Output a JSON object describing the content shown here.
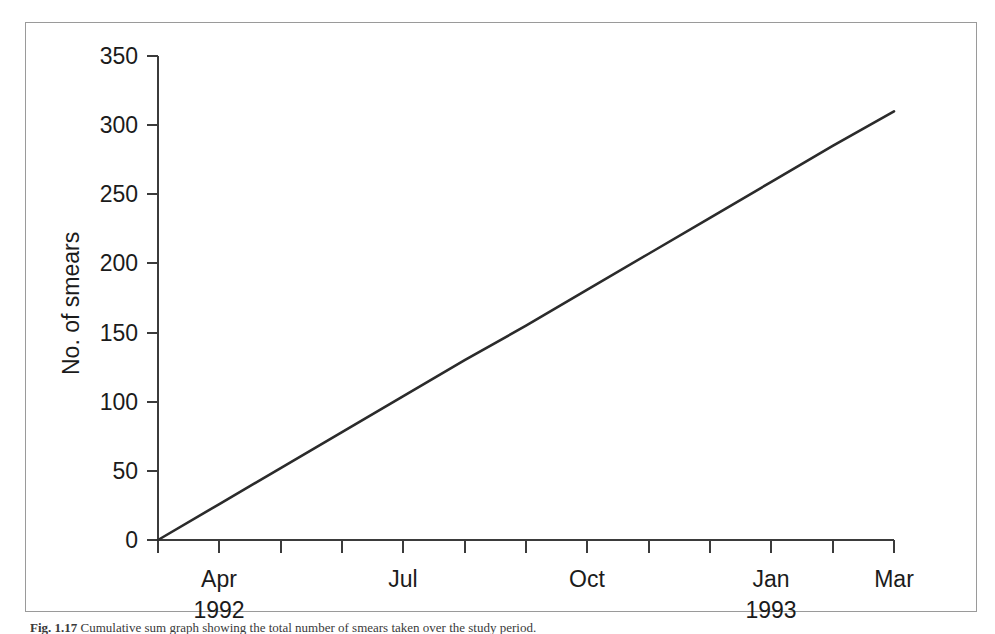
{
  "figure": {
    "caption_label": "Fig. 1.17",
    "caption_text": "Cumulative sum graph showing the total number of smears taken over the study period."
  },
  "chart_data": {
    "type": "line",
    "title": "",
    "xlabel": "",
    "ylabel": "No. of smears",
    "ylim": [
      0,
      350
    ],
    "yticks": [
      0,
      50,
      100,
      150,
      200,
      250,
      300,
      350
    ],
    "ytick_labels": [
      "0",
      "50",
      "100",
      "150",
      "200",
      "250",
      "300",
      "350"
    ],
    "grid": false,
    "legend": "none",
    "x_tick_count": 13,
    "x_tick_labels": [
      {
        "index": 1,
        "month": "Apr",
        "year": "1992"
      },
      {
        "index": 4,
        "month": "Jul",
        "year": ""
      },
      {
        "index": 7,
        "month": "Oct",
        "year": ""
      },
      {
        "index": 10,
        "month": "Jan",
        "year": "1993"
      },
      {
        "index": 12,
        "month": "Mar",
        "year": ""
      }
    ],
    "x": [
      0,
      1,
      2,
      3,
      4,
      5,
      6,
      7,
      8,
      9,
      10,
      11,
      12
    ],
    "series": [
      {
        "name": "Cumulative smears",
        "values": [
          0,
          26,
          52,
          78,
          104,
          130,
          155,
          181,
          207,
          233,
          259,
          285,
          310
        ]
      }
    ],
    "annotations": []
  },
  "axis": {
    "y_title": "No. of smears",
    "y_labels": [
      "350",
      "300",
      "250",
      "200",
      "150",
      "100",
      "50",
      "0"
    ],
    "x_month_labels": [
      "Apr",
      "Jul",
      "Oct",
      "Jan",
      "Mar"
    ],
    "x_year_labels": [
      "1992",
      "1993"
    ]
  },
  "colors": {
    "line": "#2b2b2b",
    "axis": "#3b3b3b",
    "text": "#1b1b1b",
    "frame": "#9a9a9a",
    "background": "#ffffff"
  }
}
